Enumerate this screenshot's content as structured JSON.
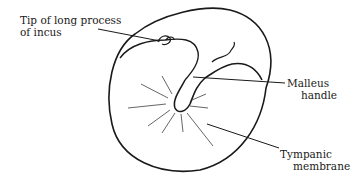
{
  "diagram": {
    "labels": {
      "incus": [
        "Tip of long process",
        "of incus"
      ],
      "malleus": [
        "Malleus",
        "handle"
      ],
      "tympanic": [
        "Tympanic",
        "membrane"
      ]
    },
    "colors": {
      "stroke": "#1a1a1a",
      "light_reflex": "#555555",
      "background": "#ffffff"
    }
  }
}
